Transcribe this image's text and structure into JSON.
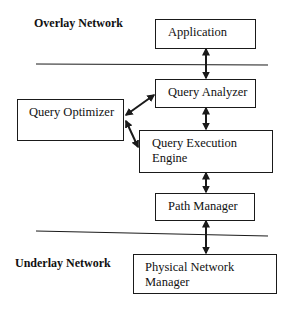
{
  "diagram": {
    "regions": {
      "overlay": "Overlay Network",
      "underlay": "Underlay Network"
    },
    "components": {
      "application": "Application",
      "query_analyzer": "Query Analyzer",
      "query_optimizer": "Query Optimizer",
      "query_execution_engine": {
        "line1": "Query Execution",
        "line2": "Engine"
      },
      "path_manager": "Path Manager",
      "physical_network_manager": {
        "line1": "Physical Network",
        "line2": "Manager"
      }
    },
    "connections": [
      {
        "from": "Application",
        "to": "Query Analyzer",
        "type": "bidirectional"
      },
      {
        "from": "Query Optimizer",
        "to": "Query Analyzer",
        "type": "bidirectional"
      },
      {
        "from": "Query Optimizer",
        "to": "Query Execution Engine",
        "type": "bidirectional"
      },
      {
        "from": "Query Analyzer",
        "to": "Query Execution Engine",
        "type": "bidirectional"
      },
      {
        "from": "Query Execution Engine",
        "to": "Path Manager",
        "type": "bidirectional"
      },
      {
        "from": "Path Manager",
        "to": "Physical Network Manager",
        "type": "bidirectional"
      }
    ],
    "colors": {
      "stroke": "#1a1a1a",
      "background": "#ffffff"
    }
  }
}
